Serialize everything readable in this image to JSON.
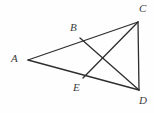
{
  "figure": {
    "background_color": "#fefefe",
    "stroke_color": "#2e2e2e",
    "label_color": "#3b3b3b",
    "stroke_width": 1.3,
    "width": 154,
    "height": 113
  },
  "points": {
    "A": {
      "label": "A",
      "x": 28,
      "y": 60,
      "label_x": 11,
      "label_y": 53
    },
    "B": {
      "label": "B",
      "x": 80,
      "y": 38,
      "label_x": 70,
      "label_y": 22
    },
    "C": {
      "label": "C",
      "x": 138,
      "y": 22,
      "label_x": 139,
      "label_y": 3
    },
    "D": {
      "label": "D",
      "x": 139,
      "y": 90,
      "label_x": 139,
      "label_y": 95
    },
    "E": {
      "label": "E",
      "x": 83,
      "y": 78,
      "label_x": 73,
      "label_y": 82
    }
  },
  "segments": [
    {
      "name": "AC",
      "from": "A",
      "to": "C"
    },
    {
      "name": "AD",
      "from": "A",
      "to": "D"
    },
    {
      "name": "CD",
      "from": "C",
      "to": "D"
    },
    {
      "name": "BD",
      "from": "B",
      "to": "D"
    },
    {
      "name": "EC",
      "from": "E",
      "to": "C"
    }
  ],
  "intersection": {
    "name": "BD-EC-crossing",
    "x": 106,
    "y": 57
  }
}
